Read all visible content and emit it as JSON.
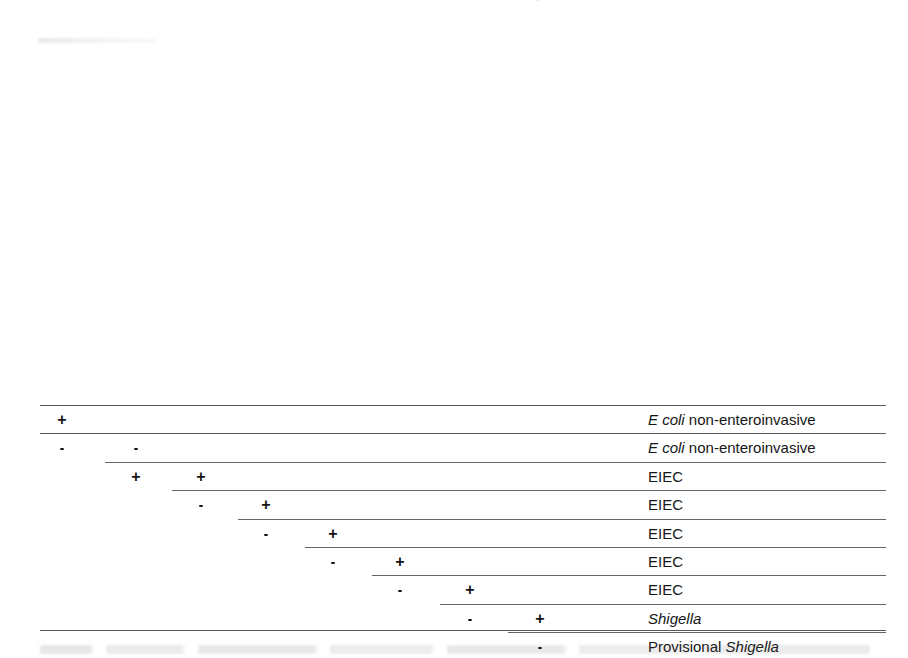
{
  "figure": {
    "type": "identification-flow-table"
  },
  "columns": [
    {
      "id": "ldc",
      "label": "LDC",
      "label_italic": "",
      "label_tail": "",
      "superscript": "a",
      "x": 62
    },
    {
      "id": "ipah",
      "label": "",
      "label_italic": "ipaH",
      "label_tail": "-gene PCR",
      "superscript": "b",
      "x": 136
    },
    {
      "id": "motility",
      "label": "Motility",
      "label_italic": "",
      "label_tail": "",
      "superscript": "c",
      "x": 201
    },
    {
      "id": "salicin",
      "label": "Salicin, acid",
      "label_italic": "",
      "label_tail": "",
      "superscript": "a",
      "x": 266
    },
    {
      "id": "esculin",
      "label": "Esculin hydrolysis",
      "label_italic": "",
      "label_tail": "",
      "superscript": "a",
      "x": 333
    },
    {
      "id": "gas_indol",
      "label": "Gas from D-Glucose and indol",
      "label_italic": "",
      "label_tail": "",
      "superscript": "a",
      "x": 400
    },
    {
      "id": "agg_eiec",
      "label": "Agglutination with EIEC associated antisera",
      "label_italic": "",
      "label_tail": "",
      "superscript": "d",
      "x": 470
    },
    {
      "id": "agg_shigella",
      "label_pre": "Agglutination with ",
      "label_italic": "Shigella",
      "label_tail": " antisera",
      "superscript": "",
      "x": 540
    }
  ],
  "rows": [
    {
      "index": 1,
      "marks": [
        {
          "column": "ldc",
          "value": "+"
        }
      ],
      "rule_start_x": 40,
      "result_pre": "",
      "result_italic": "E  coli",
      "result_post": " non-enteroinvasive"
    },
    {
      "index": 2,
      "marks": [
        {
          "column": "ldc",
          "value": "-"
        },
        {
          "column": "ipah",
          "value": "-"
        }
      ],
      "rule_start_x": 40,
      "result_pre": "",
      "result_italic": "E  coli",
      "result_post": " non-enteroinvasive"
    },
    {
      "index": 3,
      "marks": [
        {
          "column": "ipah",
          "value": "+"
        },
        {
          "column": "motility",
          "value": "+"
        }
      ],
      "rule_start_x": 105,
      "result_pre": "EIEC",
      "result_italic": "",
      "result_post": ""
    },
    {
      "index": 4,
      "marks": [
        {
          "column": "motility",
          "value": "-"
        },
        {
          "column": "salicin",
          "value": "+"
        }
      ],
      "rule_start_x": 172,
      "result_pre": "EIEC",
      "result_italic": "",
      "result_post": ""
    },
    {
      "index": 5,
      "marks": [
        {
          "column": "salicin",
          "value": "-"
        },
        {
          "column": "esculin",
          "value": "+"
        }
      ],
      "rule_start_x": 238,
      "result_pre": "EIEC",
      "result_italic": "",
      "result_post": ""
    },
    {
      "index": 6,
      "marks": [
        {
          "column": "esculin",
          "value": "-"
        },
        {
          "column": "gas_indol",
          "value": "+"
        }
      ],
      "rule_start_x": 305,
      "result_pre": "EIEC",
      "result_italic": "",
      "result_post": ""
    },
    {
      "index": 7,
      "marks": [
        {
          "column": "gas_indol",
          "value": "-"
        },
        {
          "column": "agg_eiec",
          "value": "+"
        }
      ],
      "rule_start_x": 372,
      "result_pre": "EIEC",
      "result_italic": "",
      "result_post": ""
    },
    {
      "index": 8,
      "marks": [
        {
          "column": "agg_eiec",
          "value": "-"
        },
        {
          "column": "agg_shigella",
          "value": "+"
        }
      ],
      "rule_start_x": 440,
      "result_pre": "",
      "result_italic": "Shigella",
      "result_post": ""
    },
    {
      "index": 9,
      "marks": [
        {
          "column": "agg_shigella",
          "value": "-"
        }
      ],
      "rule_start_x": 508,
      "result_pre": "Provisional ",
      "result_italic": "Shigella",
      "result_post": ""
    }
  ],
  "layout": {
    "result_column_x": 648,
    "rule_end_x": 886,
    "header_baseline_y": 400,
    "first_rule_y": 405,
    "row_height": 28.4,
    "bottom_rule_y": 630
  },
  "colors": {
    "page_background": "#ffffff",
    "ink": "#1a1a1a",
    "rule": "#4d4d4d"
  }
}
